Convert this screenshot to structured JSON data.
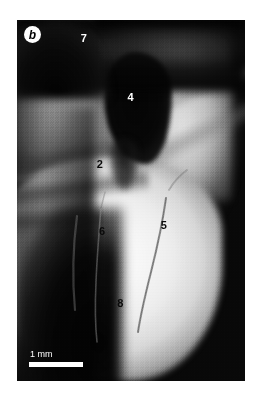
{
  "figure": {
    "panel_letter": "b",
    "type": "grayscale-micrograph",
    "background_color": "#ffffff",
    "plate_color": "#080808"
  },
  "scale_bar": {
    "label": "1 mm",
    "bar_color": "#ffffff",
    "text_color": "#ffffff"
  },
  "markers": [
    {
      "id": "marker-7",
      "label": "7",
      "tone": "light",
      "left_pct": 28.0,
      "top_pct": 3.5
    },
    {
      "id": "marker-4",
      "label": "4",
      "tone": "light",
      "left_pct": 48.5,
      "top_pct": 20.0
    },
    {
      "id": "marker-2",
      "label": "2",
      "tone": "dark",
      "left_pct": 35.0,
      "top_pct": 38.5
    },
    {
      "id": "marker-6",
      "label": "6",
      "tone": "dark",
      "left_pct": 36.0,
      "top_pct": 57.0
    },
    {
      "id": "marker-5",
      "label": "5",
      "tone": "dark",
      "left_pct": 63.0,
      "top_pct": 55.5
    },
    {
      "id": "marker-8",
      "label": "8",
      "tone": "dark",
      "left_pct": 44.0,
      "top_pct": 77.0
    }
  ],
  "features": {
    "cavity_4_name": "dark-pulp-cavity",
    "cavity_7_name": "dark-notch-cavity",
    "fissure_5_name": "curved-fissure-line",
    "fissure_6_name": "faint-fissure-line"
  }
}
